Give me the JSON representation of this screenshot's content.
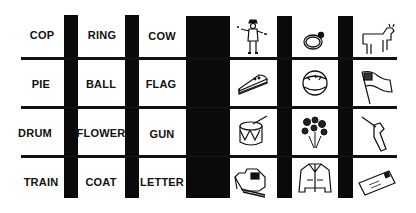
{
  "grid": {
    "words": [
      [
        "COP",
        "RING",
        "COW"
      ],
      [
        "PIE",
        "BALL",
        "FLAG"
      ],
      [
        "DRUM",
        "FLOWER",
        "GUN"
      ],
      [
        "TRAIN",
        "COAT",
        "LETTER"
      ]
    ],
    "pictures": [
      [
        "police-officer-icon",
        "ring-icon",
        "cow-icon"
      ],
      [
        "pie-slice-icon",
        "ball-icon",
        "flag-icon"
      ],
      [
        "drum-icon",
        "flowers-icon",
        "gun-icon"
      ],
      [
        "train-icon",
        "coat-icon",
        "letter-envelope-icon"
      ]
    ]
  },
  "colors": {
    "ink": "#0a0a0a",
    "background": "#ffffff"
  }
}
